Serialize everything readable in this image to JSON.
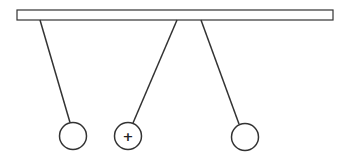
{
  "diagram": {
    "colors": {
      "stroke": "#333333",
      "rod_fill": "#ffffff",
      "background": "#ffffff"
    },
    "rod": {
      "x": 17,
      "y": 10,
      "width": 316,
      "height": 10
    },
    "pendulums": [
      {
        "id": "sphere-1",
        "top": [
          40,
          20
        ],
        "cx": 73,
        "cy": 136,
        "r": 14,
        "label": ""
      },
      {
        "id": "sphere-2",
        "top": [
          177,
          20
        ],
        "cx": 128,
        "cy": 136,
        "r": 14,
        "label": "+"
      },
      {
        "id": "sphere-3",
        "top": [
          201,
          20
        ],
        "cx": 245,
        "cy": 137,
        "r": 14,
        "label": ""
      }
    ]
  }
}
